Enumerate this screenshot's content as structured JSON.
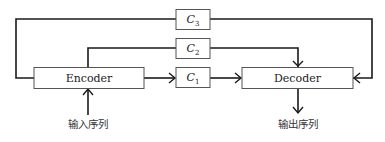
{
  "diagram": {
    "type": "encoder-decoder with multiple context vectors",
    "nodes": {
      "encoder": {
        "label": "Encoder"
      },
      "decoder": {
        "label": "Decoder"
      },
      "c1": {
        "base": "C",
        "sub": "1"
      },
      "c2": {
        "base": "C",
        "sub": "2"
      },
      "c3": {
        "base": "C",
        "sub": "3"
      }
    },
    "input_label": "输入序列",
    "output_label": "输出序列",
    "edges": [
      {
        "from": "输入序列",
        "to": "Encoder"
      },
      {
        "from": "Encoder",
        "to": "C1"
      },
      {
        "from": "Encoder",
        "to": "C2"
      },
      {
        "from": "Encoder",
        "to": "C3"
      },
      {
        "from": "C1",
        "to": "Decoder"
      },
      {
        "from": "C2",
        "to": "Decoder"
      },
      {
        "from": "C3",
        "to": "Decoder"
      },
      {
        "from": "Decoder",
        "to": "输出序列"
      }
    ],
    "colors": {
      "line": "#1a1a1a",
      "box_border": "#555555",
      "background": "#ffffff"
    }
  }
}
